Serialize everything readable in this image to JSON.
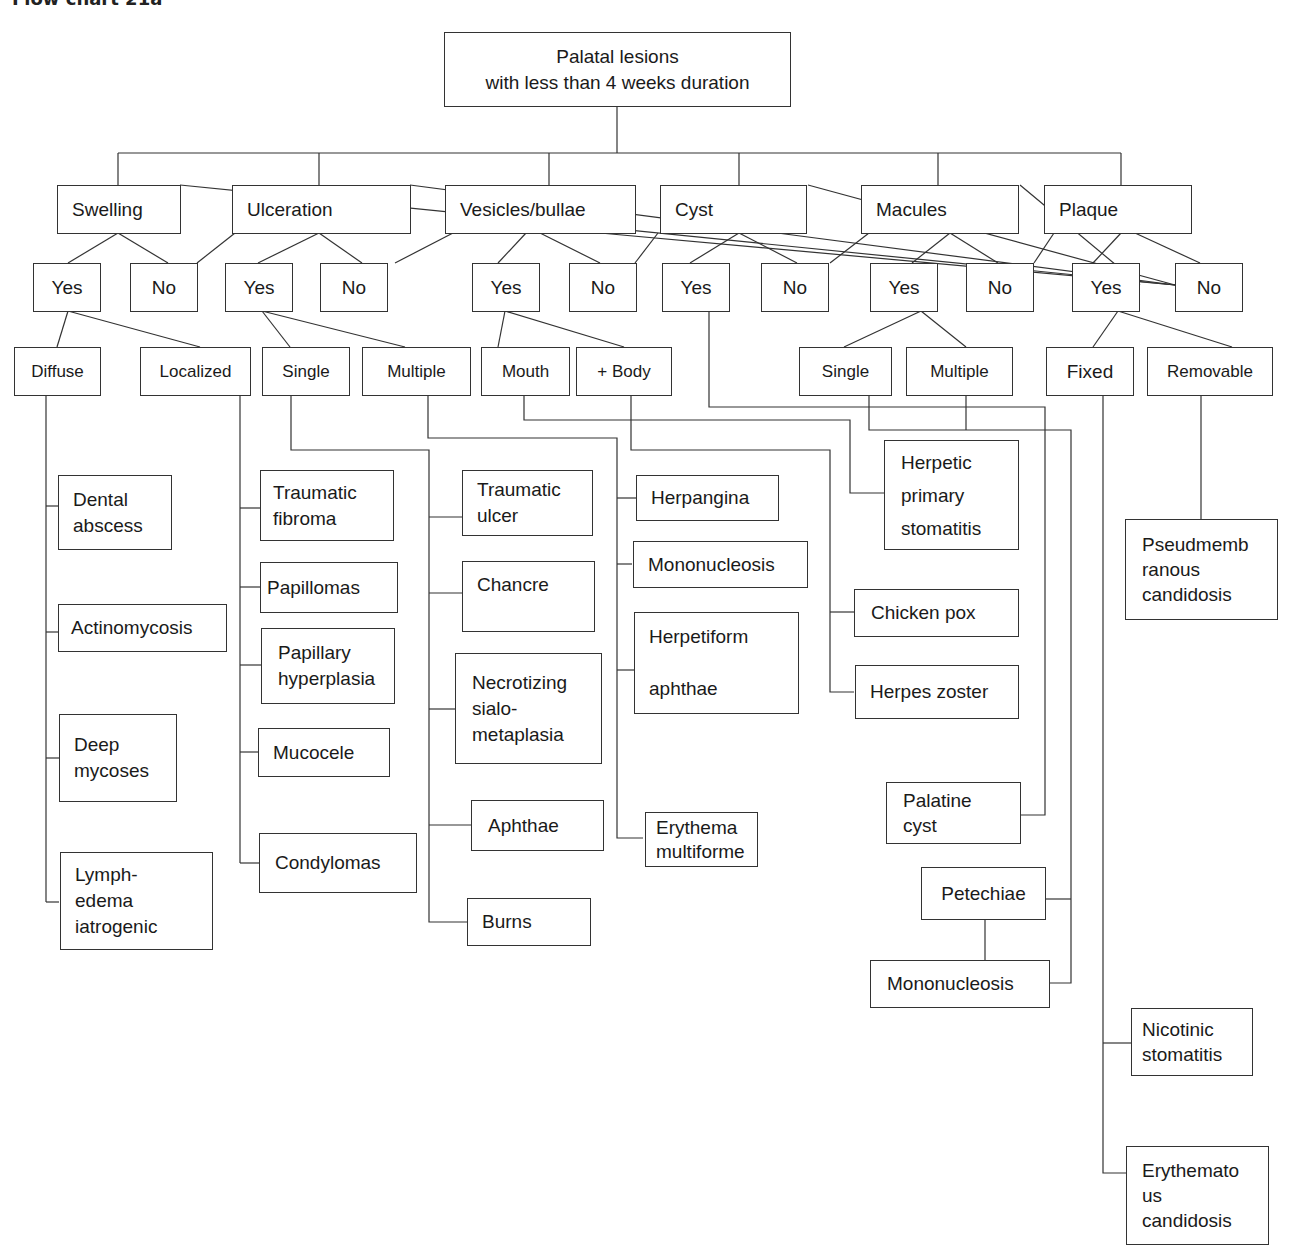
{
  "header": {
    "title": "Flow chart 21a"
  },
  "root": {
    "label": "Palatal lesions\nwith less than 4 weeks duration"
  },
  "categories": [
    {
      "label": "Swelling"
    },
    {
      "label": "Ulceration"
    },
    {
      "label": "Vesicles/bullae"
    },
    {
      "label": "Cyst"
    },
    {
      "label": "Macules"
    },
    {
      "label": "Plaque"
    }
  ],
  "answers": [
    {
      "label": "Yes"
    },
    {
      "label": "No"
    },
    {
      "label": "Yes"
    },
    {
      "label": "No"
    },
    {
      "label": "Yes"
    },
    {
      "label": "No"
    },
    {
      "label": "Yes"
    },
    {
      "label": "No"
    },
    {
      "label": "Yes"
    },
    {
      "label": "No"
    },
    {
      "label": "Yes"
    },
    {
      "label": "No"
    }
  ],
  "subtypes": [
    {
      "label": "Diffuse"
    },
    {
      "label": "Localized"
    },
    {
      "label": "Single"
    },
    {
      "label": "Multiple"
    },
    {
      "label": "Mouth"
    },
    {
      "label": "+ Body"
    },
    {
      "label": "Single"
    },
    {
      "label": "Multiple"
    },
    {
      "label": "Fixed"
    },
    {
      "label": "Removable"
    }
  ],
  "diagnoses": {
    "diffuse": [
      {
        "label": "Dental\nabscess"
      },
      {
        "label": "Actinomycosis"
      },
      {
        "label": "Deep\nmycoses"
      },
      {
        "label": "Lymph-\nedema\niatrogenic"
      }
    ],
    "localized": [
      {
        "label": "Traumatic\nfibroma"
      },
      {
        "label": "Papillomas"
      },
      {
        "label": "Papillary\nhyperplasia"
      },
      {
        "label": "Mucocele"
      },
      {
        "label": "Condylomas"
      }
    ],
    "ulcer_single_multiple": [
      {
        "label": "Traumatic\nulcer"
      },
      {
        "label": "Chancre"
      },
      {
        "label": "Necrotizing\nsialo-\nmetaplasia"
      },
      {
        "label": "Aphthae"
      },
      {
        "label": "Burns"
      }
    ],
    "vesicles_mouth": [
      {
        "label": "Herpangina"
      },
      {
        "label": "Mononucleosis"
      },
      {
        "label": "Herpetiform\n\naphthae"
      },
      {
        "label": "Erythema\nmultiforme"
      }
    ],
    "vesicles_body": [
      {
        "label": "Herpetic\nprimary\nstomatitis"
      },
      {
        "label": "Chicken pox"
      },
      {
        "label": "Herpes zoster"
      }
    ],
    "cyst_macules": [
      {
        "label": "Palatine\ncyst"
      },
      {
        "label": "Petechiae"
      },
      {
        "label": "Mononucleosis"
      }
    ],
    "plaque": [
      {
        "label": "Pseudmemb\nranous\ncandidosis"
      },
      {
        "label": "Nicotinic\nstomatitis"
      },
      {
        "label": "Erythemato\nus\ncandidosis"
      }
    ]
  }
}
